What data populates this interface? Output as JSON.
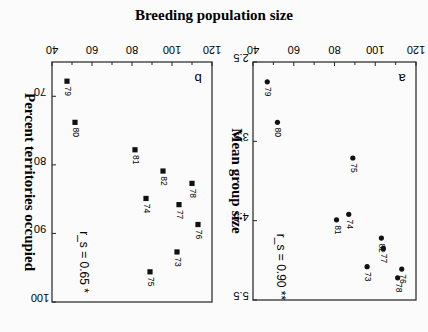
{
  "figure": {
    "orientation": "rotated 180 degrees",
    "shared_ylabel": "Breeding population size",
    "panels": [
      {
        "id": "a",
        "xlabel": "Mean group size",
        "stat": "r_s = 0.90",
        "signif": "**"
      },
      {
        "id": "b",
        "xlabel": "Percent territories occupied",
        "stat": "r_s = 0.65",
        "signif": "*"
      }
    ]
  },
  "chart_data": [
    {
      "type": "scatter",
      "title": "a",
      "xlabel": "Mean group size",
      "ylabel": "Breeding population size",
      "xlim": [
        2.5,
        5.5
      ],
      "ylim": [
        40,
        120
      ],
      "xticks": [
        "2.5",
        "3.5",
        "4.5",
        "5.5"
      ],
      "yticks": [
        "40",
        "60",
        "80",
        "100",
        "120"
      ],
      "marker": "circle",
      "annotation": "r_s = 0.90 **",
      "points": [
        {
          "label": "79",
          "x": 2.75,
          "y": 47
        },
        {
          "label": "80",
          "x": 3.26,
          "y": 52
        },
        {
          "label": "75",
          "x": 3.71,
          "y": 89
        },
        {
          "label": "74",
          "x": 4.42,
          "y": 87
        },
        {
          "label": "81",
          "x": 4.49,
          "y": 81
        },
        {
          "label": "82",
          "x": 4.72,
          "y": 103
        },
        {
          "label": "77",
          "x": 4.85,
          "y": 104
        },
        {
          "label": "73",
          "x": 5.08,
          "y": 96
        },
        {
          "label": "76",
          "x": 5.11,
          "y": 113
        },
        {
          "label": "78",
          "x": 5.22,
          "y": 111
        }
      ]
    },
    {
      "type": "scatter",
      "title": "b",
      "xlabel": "Percent territories occupied",
      "ylabel": "Breeding population size",
      "xlim": [
        65,
        100
      ],
      "ylim": [
        40,
        120
      ],
      "xticks": [
        "70",
        "80",
        "90",
        "100"
      ],
      "yticks": [
        "40",
        "60",
        "80",
        "100",
        "120"
      ],
      "marker": "square",
      "annotation": "r_s = 0.65 *",
      "points": [
        {
          "label": "79",
          "x": 67.8,
          "y": 47.5
        },
        {
          "label": "80",
          "x": 73.8,
          "y": 51.5
        },
        {
          "label": "81",
          "x": 77.8,
          "y": 81.5
        },
        {
          "label": "82",
          "x": 80.9,
          "y": 95.5
        },
        {
          "label": "78",
          "x": 82.7,
          "y": 110
        },
        {
          "label": "74",
          "x": 84.9,
          "y": 87
        },
        {
          "label": "77",
          "x": 85.8,
          "y": 103.5
        },
        {
          "label": "76",
          "x": 88.7,
          "y": 113
        },
        {
          "label": "73",
          "x": 92.7,
          "y": 102.5
        },
        {
          "label": "75",
          "x": 95.6,
          "y": 89
        }
      ]
    }
  ]
}
